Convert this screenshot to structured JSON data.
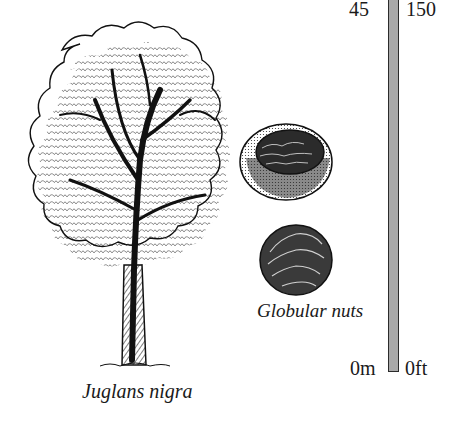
{
  "illustration": {
    "species_name": "Juglans nigra",
    "fruit_caption": "Globular nuts",
    "tree_icon": "deciduous-tree-illustration",
    "nut_icons": [
      "walnut-in-husk",
      "walnut-whole"
    ]
  },
  "height_scale": {
    "metric_top": "45",
    "imperial_top": "150",
    "metric_bottom": "0m",
    "imperial_bottom": "0ft",
    "bar_color": "#a9a9a9",
    "outline_color": "#2b2b2b"
  }
}
